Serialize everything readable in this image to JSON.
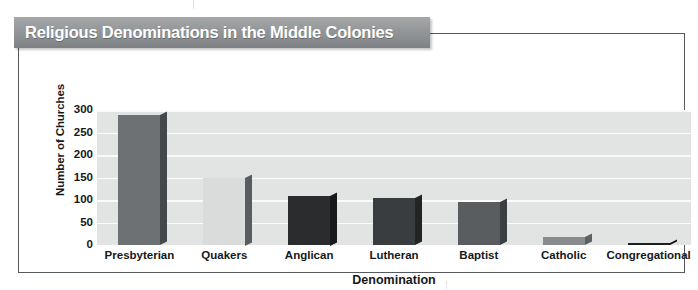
{
  "chart_data": {
    "type": "bar",
    "title": "Religious Denominations in the Middle Colonies",
    "xlabel": "Denomination",
    "ylabel": "Number of Churches",
    "categories": [
      "Presbyterian",
      "Quakers",
      "Anglican",
      "Lutheran",
      "Baptist",
      "Catholic",
      "Congregational"
    ],
    "values": [
      288,
      150,
      110,
      105,
      95,
      18,
      5
    ],
    "ylim": [
      0,
      300
    ],
    "yticks": [
      300,
      250,
      200,
      150,
      100,
      50,
      0
    ],
    "grid": true,
    "legend": "none",
    "bar_colors": [
      "#6e7174",
      "#dadbdb",
      "#2a2c2e",
      "#3a3d40",
      "#5a5d60",
      "#888b8d",
      "#1c1e20"
    ],
    "bar_side_colors": [
      "#45484b",
      "#5a5d60",
      "#18191b",
      "#222426",
      "#3c3f42",
      "#5e6164",
      "#111214"
    ],
    "plot_bg": "#e2e3e3",
    "gridline_color": "#fbfbfb",
    "title_banner_color": "#8f9294",
    "title_text_color": "#ffffff",
    "frame_color": "#555a5e"
  }
}
